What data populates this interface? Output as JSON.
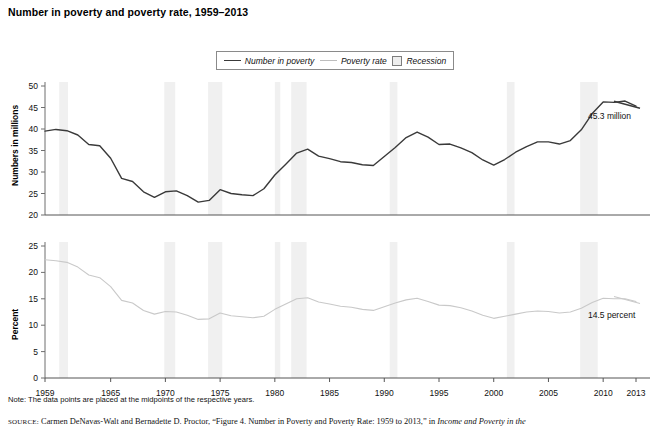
{
  "title": "Number in poverty and poverty rate, 1959–2013",
  "legend": {
    "items": [
      {
        "label": "Number in poverty",
        "marker": "line-dark",
        "color": "#3a3a3a"
      },
      {
        "label": "Poverty rate",
        "marker": "line-light",
        "color": "#bdbdbd"
      },
      {
        "label": "Recession",
        "marker": "box",
        "color": "#eeeeee"
      }
    ]
  },
  "annotations": {
    "top": "45.3 million",
    "bottom": "14.5 percent"
  },
  "note": "Note: The data points are placed at the midpoints of the respective years.",
  "source": {
    "prefix": "SOURCE:",
    "body": "Carmen DeNavas-Walt and Bernadette D. Proctor, “Figure 4. Number in Poverty and Poverty Rate: 1959 to 2013,” in",
    "italic": "Income and Poverty in the"
  },
  "chart_data": [
    {
      "type": "line",
      "id": "number-in-poverty",
      "title": "Number in poverty",
      "xlabel": "",
      "ylabel": "Numbers in millions",
      "ylim": [
        20,
        50
      ],
      "yticks": [
        20,
        25,
        30,
        35,
        40,
        45,
        50
      ],
      "xlim": [
        1959,
        2013
      ],
      "xticks": [
        1959,
        1965,
        1970,
        1975,
        1980,
        1985,
        1990,
        1995,
        2000,
        2005,
        2010,
        2013
      ],
      "grid": false,
      "legend_position": "top-center",
      "line_color": "#3a3a3a",
      "x": [
        1959,
        1960,
        1961,
        1962,
        1963,
        1964,
        1965,
        1966,
        1967,
        1968,
        1969,
        1970,
        1971,
        1972,
        1973,
        1974,
        1975,
        1976,
        1977,
        1978,
        1979,
        1980,
        1981,
        1982,
        1983,
        1984,
        1985,
        1986,
        1987,
        1988,
        1989,
        1990,
        1991,
        1992,
        1993,
        1994,
        1995,
        1996,
        1997,
        1998,
        1999,
        2000,
        2001,
        2002,
        2003,
        2004,
        2005,
        2006,
        2007,
        2008,
        2009,
        2010,
        2011,
        2012,
        2013
      ],
      "values": [
        39.5,
        39.9,
        39.6,
        38.6,
        36.4,
        36.1,
        33.2,
        28.5,
        27.8,
        25.4,
        24.1,
        25.4,
        25.6,
        24.5,
        23.0,
        23.4,
        25.9,
        25.0,
        24.7,
        24.5,
        26.1,
        29.3,
        31.8,
        34.4,
        35.3,
        33.7,
        33.1,
        32.4,
        32.2,
        31.7,
        31.5,
        33.6,
        35.7,
        38.0,
        39.3,
        38.1,
        36.4,
        36.5,
        35.6,
        34.5,
        32.8,
        31.6,
        32.9,
        34.6,
        35.9,
        37.0,
        37.0,
        36.5,
        37.3,
        39.8,
        43.6,
        46.3,
        46.2,
        46.5,
        45.3
      ],
      "label_annotation": "45.3 million"
    },
    {
      "type": "line",
      "id": "poverty-rate",
      "title": "Poverty rate",
      "xlabel": "",
      "ylabel": "Percent",
      "ylim": [
        0,
        25
      ],
      "yticks": [
        0,
        5,
        10,
        15,
        20,
        25
      ],
      "xlim": [
        1959,
        2013
      ],
      "xticks": [
        1959,
        1965,
        1970,
        1975,
        1980,
        1985,
        1990,
        1995,
        2000,
        2005,
        2010,
        2013
      ],
      "grid": false,
      "line_color": "#c9c9c9",
      "x": [
        1959,
        1960,
        1961,
        1962,
        1963,
        1964,
        1965,
        1966,
        1967,
        1968,
        1969,
        1970,
        1971,
        1972,
        1973,
        1974,
        1975,
        1976,
        1977,
        1978,
        1979,
        1980,
        1981,
        1982,
        1983,
        1984,
        1985,
        1986,
        1987,
        1988,
        1989,
        1990,
        1991,
        1992,
        1993,
        1994,
        1995,
        1996,
        1997,
        1998,
        1999,
        2000,
        2001,
        2002,
        2003,
        2004,
        2005,
        2006,
        2007,
        2008,
        2009,
        2010,
        2011,
        2012,
        2013
      ],
      "values": [
        22.4,
        22.2,
        21.9,
        21.0,
        19.5,
        19.0,
        17.3,
        14.7,
        14.2,
        12.8,
        12.1,
        12.6,
        12.5,
        11.9,
        11.1,
        11.2,
        12.3,
        11.8,
        11.6,
        11.4,
        11.7,
        13.0,
        14.0,
        15.0,
        15.2,
        14.4,
        14.0,
        13.6,
        13.4,
        13.0,
        12.8,
        13.5,
        14.2,
        14.8,
        15.1,
        14.5,
        13.8,
        13.7,
        13.3,
        12.7,
        11.9,
        11.3,
        11.7,
        12.1,
        12.5,
        12.7,
        12.6,
        12.3,
        12.5,
        13.2,
        14.3,
        15.1,
        15.0,
        15.0,
        14.5
      ],
      "label_annotation": "14.5 percent"
    }
  ],
  "recessions": [
    {
      "start": 1960.3,
      "end": 1961.1
    },
    {
      "start": 1969.9,
      "end": 1970.9
    },
    {
      "start": 1973.9,
      "end": 1975.2
    },
    {
      "start": 1980.0,
      "end": 1980.5
    },
    {
      "start": 1981.5,
      "end": 1982.9
    },
    {
      "start": 1990.5,
      "end": 1991.2
    },
    {
      "start": 2001.2,
      "end": 2001.9
    },
    {
      "start": 2007.9,
      "end": 2009.5
    }
  ],
  "axis_xticks": [
    1959,
    1965,
    1970,
    1975,
    1980,
    1985,
    1990,
    1995,
    2000,
    2005,
    2010,
    2013
  ]
}
